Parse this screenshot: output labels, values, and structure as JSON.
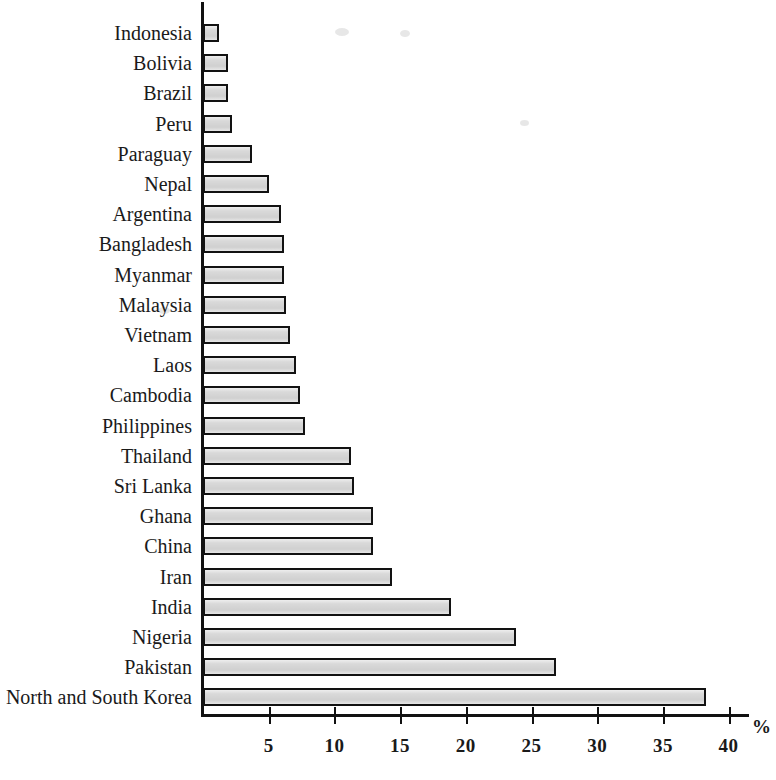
{
  "chart_data": {
    "type": "bar",
    "orientation": "horizontal",
    "title": "",
    "subtitle": "",
    "xlabel": "%",
    "ylabel": "",
    "xlim": [
      0,
      42
    ],
    "grid": false,
    "legend": null,
    "axis_unit": "%",
    "xticks": [
      5,
      10,
      15,
      20,
      25,
      30,
      35,
      40
    ],
    "xtick_labels": [
      "5",
      "10",
      "15",
      "20",
      "25",
      "30",
      "35",
      "40"
    ],
    "categories": [
      "Indonesia",
      "Bolivia",
      "Brazil",
      "Peru",
      "Paraguay",
      "Nepal",
      "Argentina",
      "Bangladesh",
      "Myanmar",
      "Malaysia",
      "Vietnam",
      "Laos",
      "Cambodia",
      "Philippines",
      "Thailand",
      "Sri Lanka",
      "Ghana",
      "China",
      "Iran",
      "India",
      "Nigeria",
      "Pakistan",
      "North and South Korea"
    ],
    "values": [
      1.2,
      1.9,
      1.9,
      2.2,
      3.7,
      5.0,
      5.9,
      6.2,
      6.2,
      6.3,
      6.6,
      7.1,
      7.4,
      7.8,
      11.3,
      11.5,
      12.9,
      12.9,
      14.4,
      18.9,
      23.8,
      26.9,
      38.3
    ],
    "colors": {
      "bar_fill": "#d9d9d9",
      "bar_edge": "#121212",
      "axis": "#111111",
      "text": "#1a1a1a",
      "background": "#ffffff"
    }
  }
}
